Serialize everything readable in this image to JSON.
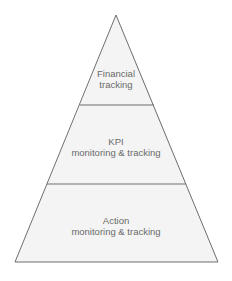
{
  "diagram": {
    "type": "pyramid",
    "colors": {
      "fill": "#f4f4f4",
      "stroke": "#6e6e6e",
      "text": "#6a6a6a",
      "background": "#ffffff"
    },
    "levels": [
      {
        "line1": "Financial",
        "line2": "tracking"
      },
      {
        "line1": "KPI",
        "line2": "monitoring & tracking"
      },
      {
        "line1": "Action",
        "line2": "monitoring & tracking"
      }
    ]
  }
}
